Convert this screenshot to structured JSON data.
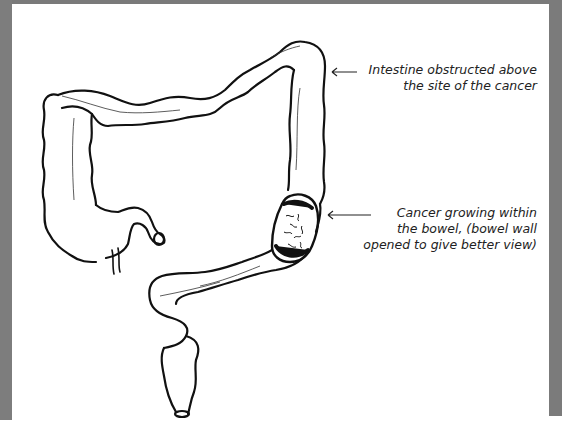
{
  "diagram": {
    "colors": {
      "frame": "#7b7b7b",
      "paper": "#ffffff",
      "ink": "#111111"
    },
    "annotations": [
      {
        "id": "obstruction",
        "line1": "Intestine obstructed above",
        "line2": "the site of the cancer"
      },
      {
        "id": "cancer",
        "line1": "Cancer growing within",
        "line2": "the bowel, (bowel wall",
        "line3": "opened to give better view)"
      }
    ]
  }
}
